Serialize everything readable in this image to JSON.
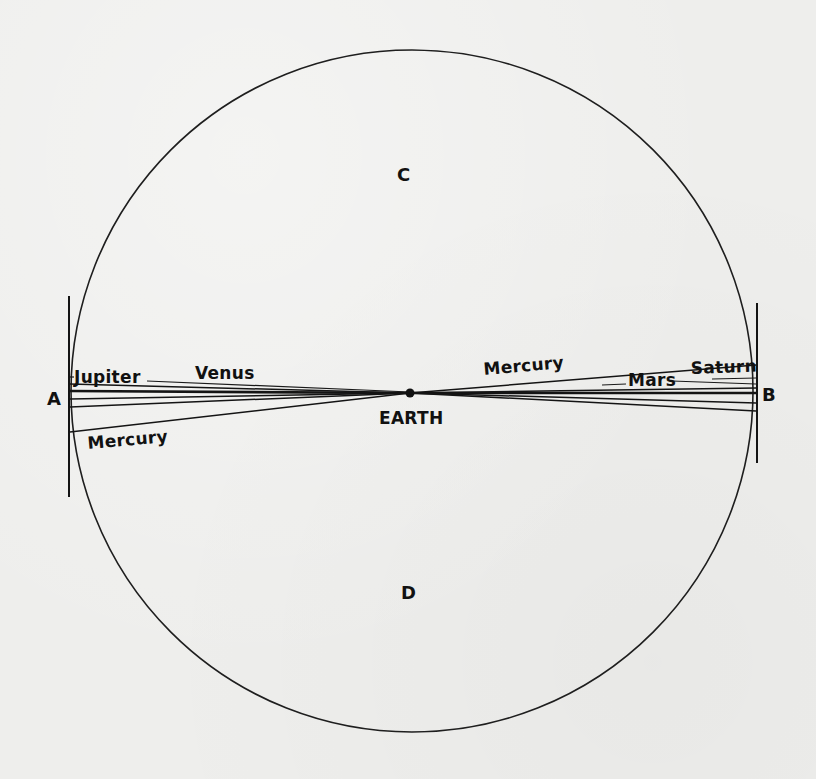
{
  "figure": {
    "background_color": "#eeeeec",
    "ink_color": "#141414"
  },
  "circle": {
    "cx": 412,
    "cy": 391,
    "r": 341
  },
  "earth": {
    "x": 410,
    "y": 393,
    "r": 4.5,
    "label": "EARTH",
    "label_x": 379,
    "label_y": 424
  },
  "points": [
    {
      "id": "A",
      "label": "A",
      "x": 47,
      "y": 405
    },
    {
      "id": "B",
      "label": "B",
      "x": 762,
      "y": 401
    },
    {
      "id": "C",
      "label": "C",
      "x": 397,
      "y": 181
    },
    {
      "id": "D",
      "label": "D",
      "x": 401,
      "y": 599
    }
  ],
  "tangent_bars": [
    {
      "id": "tangent-bar-A",
      "x1": 69,
      "y1": 296,
      "x2": 69,
      "y2": 497
    },
    {
      "id": "tangent-bar-B",
      "x1": 757,
      "y1": 303,
      "x2": 757,
      "y2": 463
    }
  ],
  "sight_lines": [
    {
      "side": "A",
      "x1": 70,
      "y1": 384,
      "x2": 410,
      "y2": 393,
      "bold": false
    },
    {
      "side": "A",
      "x1": 70,
      "y1": 391,
      "x2": 410,
      "y2": 393,
      "bold": true
    },
    {
      "side": "A",
      "x1": 70,
      "y1": 399,
      "x2": 410,
      "y2": 393,
      "bold": false
    },
    {
      "side": "A",
      "x1": 70,
      "y1": 407,
      "x2": 410,
      "y2": 393,
      "bold": false
    },
    {
      "side": "A",
      "x1": 70,
      "y1": 432,
      "x2": 410,
      "y2": 393,
      "bold": false
    },
    {
      "side": "B",
      "x1": 410,
      "y1": 393,
      "x2": 756,
      "y2": 365,
      "bold": false
    },
    {
      "side": "B",
      "x1": 410,
      "y1": 393,
      "x2": 756,
      "y2": 388,
      "bold": false
    },
    {
      "side": "B",
      "x1": 410,
      "y1": 393,
      "x2": 756,
      "y2": 393,
      "bold": true
    },
    {
      "side": "B",
      "x1": 410,
      "y1": 393,
      "x2": 756,
      "y2": 403,
      "bold": false
    },
    {
      "side": "B",
      "x1": 410,
      "y1": 393,
      "x2": 756,
      "y2": 411,
      "bold": false
    }
  ],
  "leader_lines": [
    {
      "planet": "Jupiter",
      "x1": 70,
      "y1": 377,
      "x2": 74,
      "y2": 377
    },
    {
      "planet": "Venus",
      "x1": 147,
      "y1": 381,
      "x2": 410,
      "y2": 392
    },
    {
      "planet": "Mars",
      "x1": 602,
      "y1": 385,
      "x2": 626,
      "y2": 384
    },
    {
      "planet": "Mars",
      "x1": 672,
      "y1": 381,
      "x2": 756,
      "y2": 384
    },
    {
      "planet": "Saturn",
      "x1": 712,
      "y1": 379,
      "x2": 756,
      "y2": 378
    }
  ],
  "planet_labels": [
    {
      "name": "Jupiter",
      "text": "Jupiter",
      "x": 74,
      "y": 383,
      "rotate": 0
    },
    {
      "name": "Venus",
      "text": "Venus",
      "x": 195,
      "y": 379,
      "rotate": 0
    },
    {
      "name": "Mercury-left",
      "text": "Mercury",
      "x": 88,
      "y": 449,
      "rotate": -5
    },
    {
      "name": "Mercury-right",
      "text": "Mercury",
      "x": 484,
      "y": 375,
      "rotate": -5
    },
    {
      "name": "Mars",
      "text": "Mars",
      "x": 628,
      "y": 386,
      "rotate": 0
    },
    {
      "name": "Saturn",
      "text": "Saturn",
      "x": 691,
      "y": 374,
      "rotate": -2
    }
  ]
}
